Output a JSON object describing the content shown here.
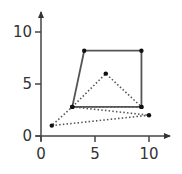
{
  "chart_data": {
    "type": "scatter",
    "title": "",
    "xlabel": "",
    "ylabel": "",
    "xlim": [
      0,
      12
    ],
    "ylim": [
      0,
      12
    ],
    "x_ticks": [
      0,
      5,
      10
    ],
    "y_ticks": [
      0,
      5,
      10
    ],
    "x_tick_labels": [
      "0",
      "5",
      "10"
    ],
    "y_tick_labels": [
      "0",
      "5",
      "10"
    ],
    "grid": false,
    "series": [
      {
        "name": "quadrilateral",
        "style": "solid",
        "closed": true,
        "points": [
          [
            4,
            8.2
          ],
          [
            9.3,
            8.2
          ],
          [
            9.3,
            2.8
          ],
          [
            2.9,
            2.8
          ]
        ]
      },
      {
        "name": "triangle",
        "style": "dotted",
        "closed": true,
        "points": [
          [
            2.9,
            2.8
          ],
          [
            6,
            6
          ],
          [
            9.3,
            2.8
          ]
        ]
      },
      {
        "name": "triangle-outer",
        "style": "dotted",
        "closed": true,
        "points": [
          [
            1,
            1
          ],
          [
            10,
            2
          ],
          [
            2.9,
            2.8
          ]
        ]
      }
    ],
    "colors": {
      "line": "#555555",
      "axis": "#333333",
      "point": "#111111"
    }
  }
}
